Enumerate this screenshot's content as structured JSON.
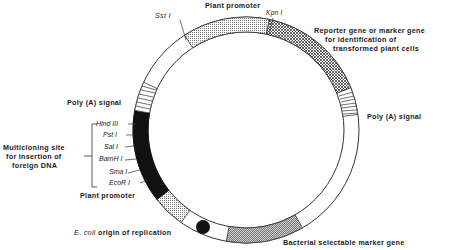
{
  "diagram": {
    "type": "plasmid-vector-map",
    "labels": {
      "top_promoter": "Plant promoter",
      "sst": "Sst I",
      "kpn": "Kpn I",
      "reporter_line1": "Reporter gene or marker gene",
      "reporter_line2": "for identification of",
      "reporter_line3": "transformed plant cells",
      "polya_right": "Poly (A) signal",
      "polya_left": "Poly (A) signal",
      "mcs_line1": "Multicloning site",
      "mcs_line2": "for insertion of",
      "mcs_line3": "foreign DNA",
      "bottom_promoter": "Plant promoter",
      "ori_italic": "E. coli",
      "ori_rest": " origin of replication",
      "bacterial_marker": "Bacterial selectable marker gene"
    },
    "restriction_sites": [
      "Hind III",
      "Pst I",
      "Sal I",
      "BamH I",
      "Sma I",
      "EcoR I"
    ],
    "colors": {
      "ink": "#1a1a1a",
      "mcs_fill": "#111111",
      "background": "#ffffff"
    }
  }
}
